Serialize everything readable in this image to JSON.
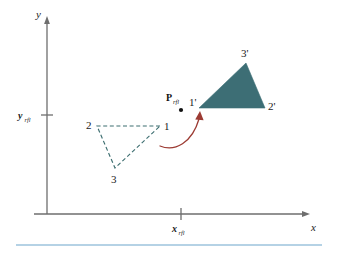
{
  "figure": {
    "title_alt": "Reflection of a triangle about a reflection point",
    "background_color": "#ffffff",
    "axes": {
      "x_axis_label": "x",
      "y_axis_label": "y",
      "axis_color": "#6e6e6e",
      "x_tick": {
        "label_main": "x",
        "label_sub": "rfl"
      },
      "y_tick": {
        "label_main": "y",
        "label_sub": "rfl"
      }
    },
    "reflection_point": {
      "label_main": "P",
      "label_sub": "rfl",
      "dot_color": "#111111"
    },
    "source_triangle": {
      "style": "dashed",
      "stroke_color": "#3d6e70",
      "vertices": [
        {
          "label": "1",
          "x": 160,
          "y": 126
        },
        {
          "label": "2",
          "x": 97,
          "y": 126
        },
        {
          "label": "3",
          "x": 115,
          "y": 168
        }
      ]
    },
    "image_triangle": {
      "style": "filled",
      "fill_color": "#3d6e75",
      "vertices": [
        {
          "label": "1'",
          "x": 199,
          "y": 108
        },
        {
          "label": "2'",
          "x": 265,
          "y": 108
        },
        {
          "label": "3'",
          "x": 246,
          "y": 63
        }
      ]
    },
    "motion_arrow": {
      "color": "#9c3b33",
      "description": "curved-arrow-icon"
    },
    "footer_rule": {
      "color": "#9dc3dc"
    }
  }
}
